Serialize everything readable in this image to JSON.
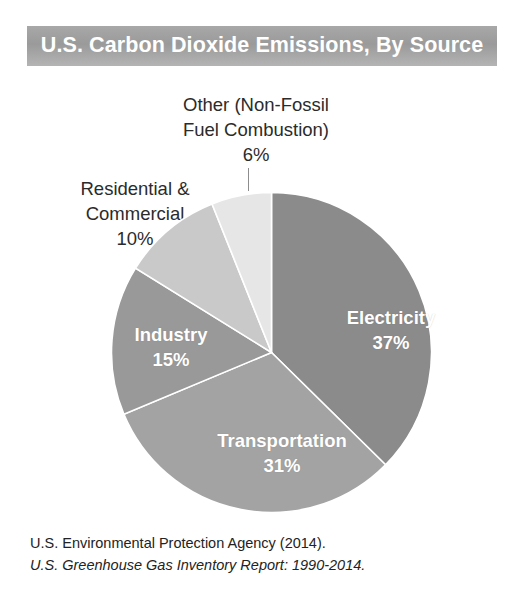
{
  "title": "U.S. Carbon Dioxide Emissions, By Source",
  "labels": {
    "other_line1": "Other (Non-Fossil",
    "other_line2": "Fuel Combustion)",
    "other_value": "6%",
    "residential_line1": "Residential &",
    "residential_line2": "Commercial",
    "residential_value": "10%",
    "electricity_name": "Electricity",
    "electricity_value": "37%",
    "transportation_name": "Transportation",
    "transportation_value": "31%",
    "industry_name": "Industry",
    "industry_value": "15%"
  },
  "source": {
    "line1": "U.S. Environmental Protection Agency (2014).",
    "line2": "U.S. Greenhouse Gas Inventory Report: 1990-2014."
  },
  "chart_data": {
    "type": "pie",
    "title": "U.S. Carbon Dioxide Emissions, By Source",
    "xlabel": "",
    "ylabel": "",
    "units": "percent",
    "start_angle_deg": 0,
    "direction": "clockwise",
    "grid": false,
    "legend": false,
    "label_position": "mixed-inside-and-outside",
    "categories": [
      "Electricity",
      "Transportation",
      "Industry",
      "Residential & Commercial",
      "Other (Non-Fossil Fuel Combustion)"
    ],
    "values": [
      37,
      31,
      15,
      10,
      6
    ],
    "value_labels": [
      "37%",
      "31%",
      "15%",
      "10%",
      "6%"
    ],
    "colors": [
      "#8b8b8b",
      "#a3a3a3",
      "#999999",
      "#c9c9c9",
      "#e6e6e6"
    ],
    "slice_label_colors": [
      "#ffffff",
      "#ffffff",
      "#ffffff",
      "#2b2b2b",
      "#2b2b2b"
    ],
    "slice_border_color": "#ffffff",
    "annotations": [
      "U.S. Environmental Protection Agency (2014).",
      "U.S. Greenhouse Gas Inventory Report: 1990-2014."
    ]
  },
  "style": {
    "banner_color": "#9a9a9a",
    "banner_text_color": "#ffffff",
    "background": "#ffffff",
    "text_color": "#2b2b2b"
  }
}
